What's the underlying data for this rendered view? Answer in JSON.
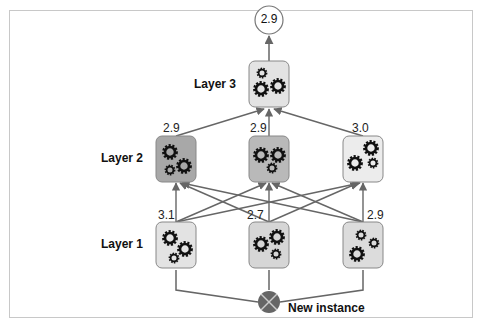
{
  "diagram": {
    "type": "stacking-ensemble",
    "output": {
      "value": "2.9"
    },
    "input": {
      "label": "New instance"
    },
    "layers": [
      {
        "name": "Layer 1",
        "predictors": [
          {
            "score": "3.1",
            "fill": "#e3e3e3"
          },
          {
            "score": "2.7",
            "fill": "#d6d6d6"
          },
          {
            "score": "2.9",
            "fill": "#dcdcdc"
          }
        ]
      },
      {
        "name": "Layer 2",
        "predictors": [
          {
            "score": "2.9",
            "fill": "#a8a8a8"
          },
          {
            "score": "2.9",
            "fill": "#b9b9b9"
          },
          {
            "score": "3.0",
            "fill": "#ececec"
          }
        ]
      },
      {
        "name": "Layer 3",
        "predictors": [
          {
            "score": "",
            "fill": "#e3e3e3"
          }
        ]
      }
    ],
    "colors": {
      "arrow": "#666666",
      "box_border": "#888888",
      "input_node": "#666666",
      "frame": "#c8c8c8"
    }
  }
}
